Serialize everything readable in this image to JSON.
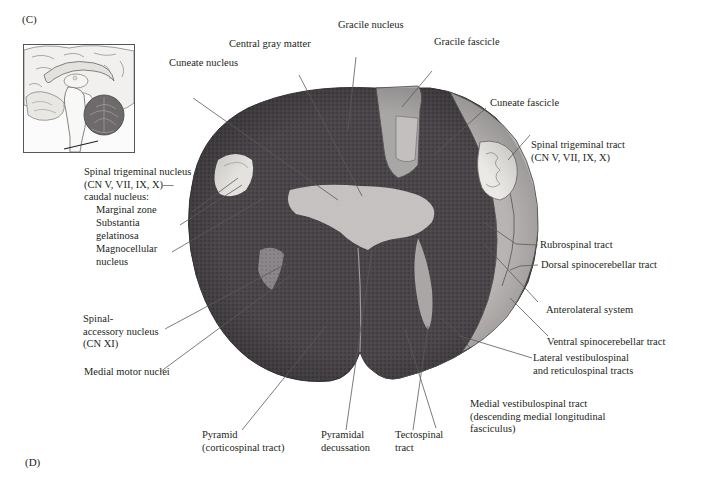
{
  "figure": {
    "panel_top": "(C)",
    "panel_bottom": "(D)",
    "inset": {
      "description": "Midsagittal brain view with pointer indicating level of section (caudal medulla)"
    },
    "colors": {
      "background": "#ffffff",
      "tissue_dark": "#3d3a3d",
      "tissue_mid": "#6b676b",
      "gray_matter_light": "#c9c6c5",
      "trigeminal_pale": "#ebe9e6",
      "outline": "#4a4a4a",
      "leader": "#555555",
      "text": "#231f20"
    },
    "labels": {
      "gracile_nucleus": [
        "Gracile nucleus"
      ],
      "central_gray_matter": [
        "Central gray matter"
      ],
      "gracile_fascicle": [
        "Gracile fascicle"
      ],
      "cuneate_nucleus": [
        "Cuneate nucleus"
      ],
      "cuneate_fascicle": [
        "Cuneate fascicle"
      ],
      "spinal_trigeminal_tract": [
        "Spinal trigeminal tract",
        "(CN V, VII, IX, X)"
      ],
      "spinal_trigeminal_nucleus": [
        "Spinal trigeminal nucleus",
        "(CN V, VII, IX, X)—",
        "caudal nucleus:"
      ],
      "marginal_zone": [
        "Marginal zone"
      ],
      "substantia_gelatinosa": [
        "Substantia",
        "gelatinosa"
      ],
      "magnocellular_nucleus": [
        "Magnocellular",
        "nucleus"
      ],
      "rubrospinal_tract": [
        "Rubrospinal tract"
      ],
      "dorsal_spinocerebellar_tract": [
        "Dorsal spinocerebellar tract"
      ],
      "anterolateral_system": [
        "Anterolateral system"
      ],
      "spinal_accessory_nucleus": [
        "Spinal-",
        "accessory nucleus",
        "(CN XI)"
      ],
      "ventral_spinocerebellar_tract": [
        "Ventral spinocerebellar tract"
      ],
      "lateral_vestibulospinal": [
        "Lateral vestibulospinal",
        "and reticulospinal tracts"
      ],
      "medial_motor_nuclei": [
        "Medial motor nuclei"
      ],
      "medial_vestibulospinal": [
        "Medial vestibulospinal tract",
        "(descending medial longitudinal",
        "fasciculus)"
      ],
      "pyramid": [
        "Pyramid",
        "(corticospinal tract)"
      ],
      "pyramidal_decussation": [
        "Pyramidal",
        "decussation"
      ],
      "tectospinal_tract": [
        "Tectospinal",
        "tract"
      ]
    }
  }
}
